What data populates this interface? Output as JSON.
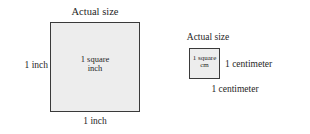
{
  "figure": {
    "title_hidden": "",
    "background_color": "#ffffff",
    "shape_fill_color": "#ededed",
    "shape_border_color": "#3a3a3a",
    "text_color": "#262626",
    "inch_figure": {
      "caption": "Actual size",
      "inner_label": "1 square\ninch",
      "inner_label_line1": "1 square",
      "inner_label_line2": "inch",
      "left_dimension": "1 inch",
      "bottom_dimension": "1 inch"
    },
    "cm_figure": {
      "caption": "Actual size",
      "inner_label_line1": "1 square",
      "inner_label_line2": "cm",
      "right_dimension": "1 centimeter",
      "bottom_dimension": "1 centimeter"
    }
  }
}
